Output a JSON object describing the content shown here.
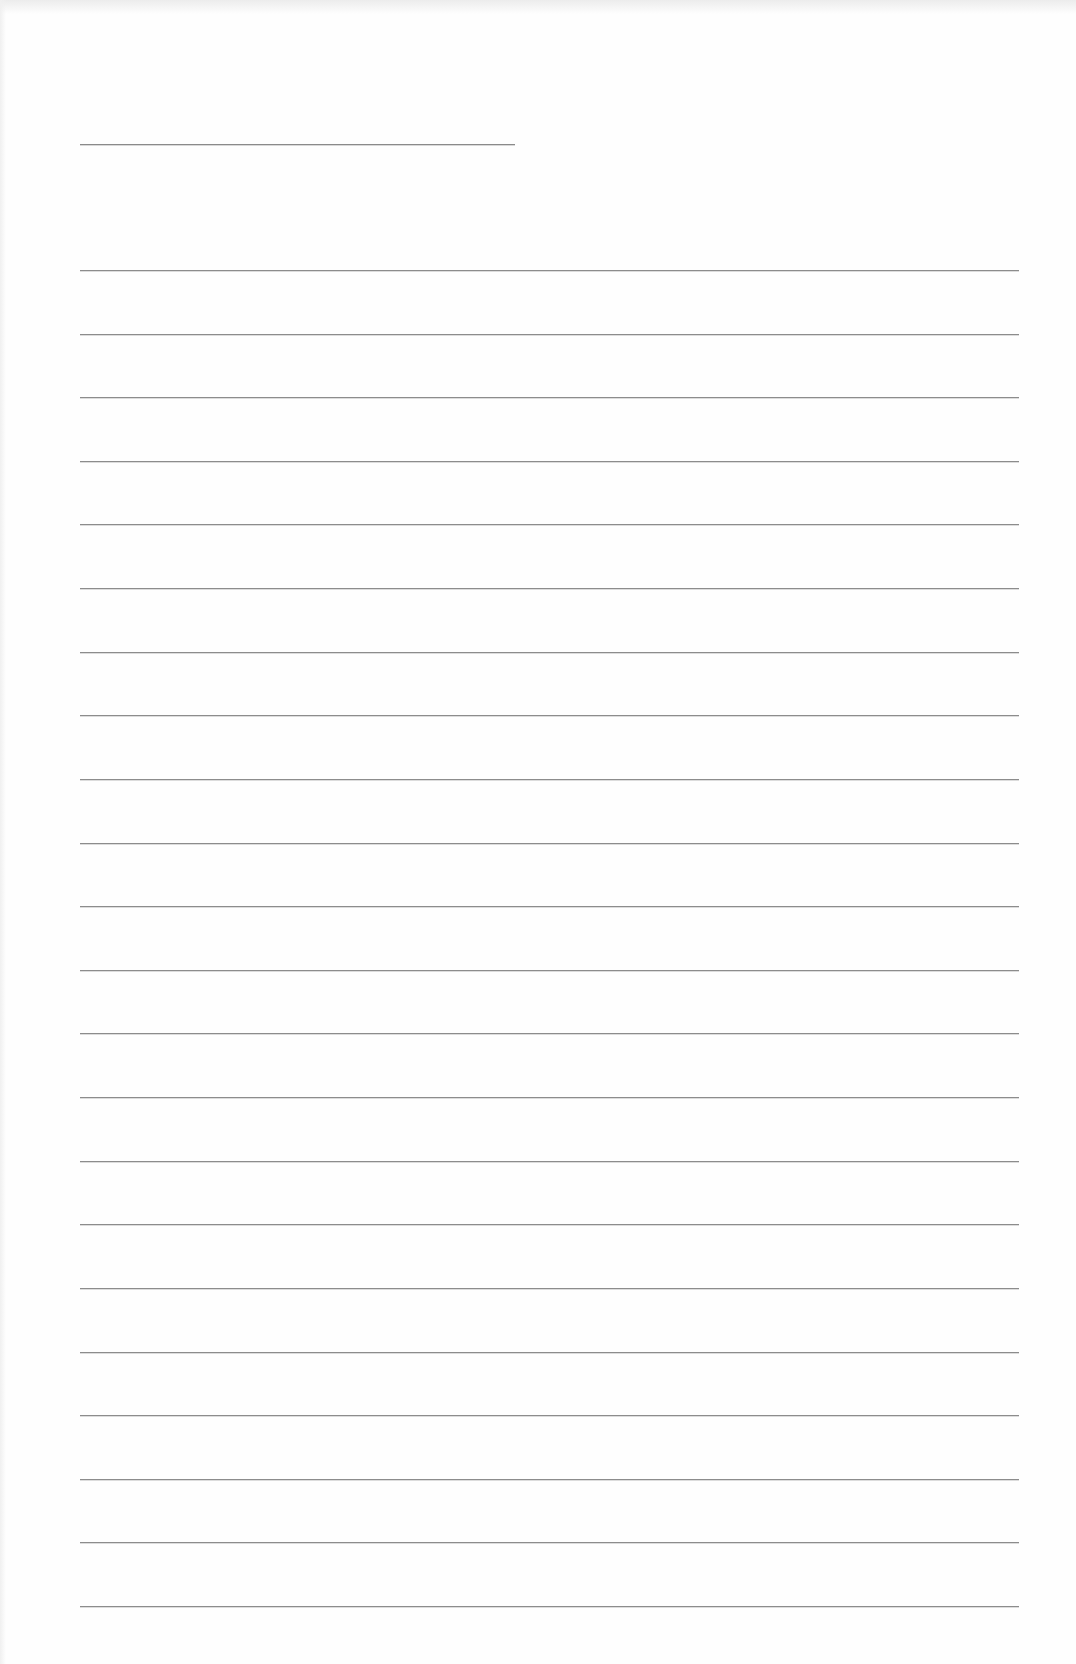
{
  "page": {
    "type": "lined-paper",
    "background_color": "#fefefe",
    "line_color": "#8c8c8c",
    "header_line": {
      "present": true
    },
    "ruled_lines": {
      "count": 22
    },
    "text_content": ""
  }
}
